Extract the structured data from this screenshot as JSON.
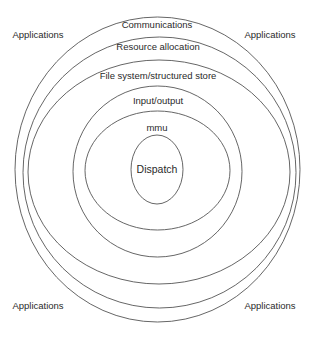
{
  "diagram": {
    "type": "concentric-layers",
    "layers": [
      {
        "id": "communications",
        "label": "Communications"
      },
      {
        "id": "resource-allocation",
        "label": "Resource allocation"
      },
      {
        "id": "file-system",
        "label": "File system/structured store"
      },
      {
        "id": "input-output",
        "label": "Input/output"
      },
      {
        "id": "mmu",
        "label": "mmu"
      },
      {
        "id": "dispatch",
        "label": "Dispatch"
      }
    ],
    "outside": {
      "top_left": "Applications",
      "top_right": "Applications",
      "bottom_left": "Applications",
      "bottom_right": "Applications"
    },
    "stroke_color": "#555555"
  }
}
